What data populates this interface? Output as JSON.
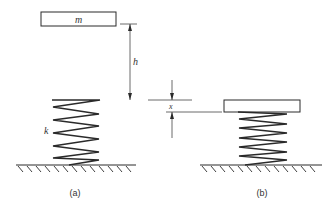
{
  "diagram": {
    "panels": [
      {
        "id": "a",
        "caption": "(a)",
        "mass_label": "m",
        "spring_label": "k",
        "height_label": "h"
      },
      {
        "id": "b",
        "caption": "(b)",
        "compression_label": "x"
      }
    ]
  }
}
